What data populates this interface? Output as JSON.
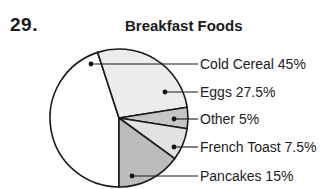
{
  "problem": {
    "number": "29."
  },
  "chart_data": {
    "type": "pie",
    "title": "Breakfast Foods",
    "categories": [
      "Cold Cereal",
      "Eggs",
      "Other",
      "French Toast",
      "Pancakes"
    ],
    "values": [
      45,
      27.5,
      5,
      7.5,
      15
    ],
    "unit": "%",
    "labels": [
      {
        "text": "Cold Cereal 45%",
        "fill": "#ffffff"
      },
      {
        "text": "Eggs 27.5%",
        "fill": "#ececec"
      },
      {
        "text": "Other 5%",
        "fill": "#c6c6c6"
      },
      {
        "text": "French Toast 7.5%",
        "fill": "#e2e2e2"
      },
      {
        "text": "Pancakes 15%",
        "fill": "#bcbcbc"
      }
    ],
    "legend_position": "right, leader lines"
  }
}
